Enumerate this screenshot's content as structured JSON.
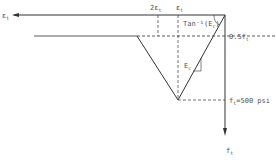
{
  "diagram": {
    "type": "stress-strain (tension softening) diagram",
    "axes": {
      "horizontal_label": "ε_t",
      "vertical_label": "f_t"
    },
    "labels": {
      "two_eps": "2ε",
      "two_eps_sub": "t",
      "eps": "ε",
      "eps_sub": "t",
      "h_axis": "ε",
      "h_axis_sub": "t",
      "tan_label": "Tan⁻¹(E",
      "tan_sub": "c",
      "tan_close": ")",
      "half_ft": "0.5f",
      "half_ft_sub": "t",
      "ec": "E",
      "ec_sub": "c",
      "ft_value": "f",
      "ft_value_sub": "t",
      "ft_value_rest": "=500 psi",
      "v_axis": "f",
      "v_axis_sub": "t"
    },
    "colors": {
      "line": "#333333",
      "text": "#555555"
    }
  }
}
